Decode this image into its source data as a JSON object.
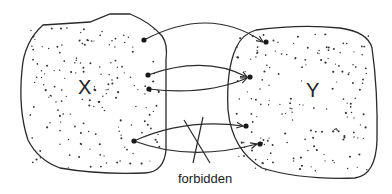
{
  "diagram": {
    "sets": [
      {
        "id": "X",
        "label": "X",
        "label_pos": [
          84,
          94
        ]
      },
      {
        "id": "Y",
        "label": "Y",
        "label_pos": [
          313,
          97
        ]
      }
    ],
    "mappings": [
      {
        "from": "X",
        "to": "Y",
        "from_point": [
          144,
          40
        ],
        "to_point": [
          266,
          42
        ],
        "allowed": true
      },
      {
        "from": "X",
        "to": "Y",
        "from_point": [
          148,
          75
        ],
        "to_point": [
          250,
          77
        ],
        "allowed": true
      },
      {
        "from": "X",
        "to": "Y",
        "from_point": [
          149,
          89
        ],
        "to_point": [
          250,
          77
        ],
        "allowed": true
      },
      {
        "from": "X",
        "to": "Y",
        "from_point": [
          134,
          141
        ],
        "to_point": [
          246,
          126
        ],
        "allowed": false
      },
      {
        "from": "X",
        "to": "Y",
        "from_point": [
          134,
          141
        ],
        "to_point": [
          260,
          144
        ],
        "allowed": false
      }
    ],
    "forbidden_label": "forbidden",
    "colors": {
      "stroke": "#2a2a2a",
      "dot": "#1a1a1a",
      "background": "#ffffff"
    }
  }
}
